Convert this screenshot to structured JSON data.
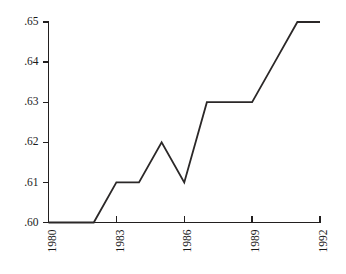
{
  "chart_data": {
    "type": "line",
    "title": "",
    "xlabel": "",
    "ylabel": "",
    "x": [
      1980,
      1981,
      1982,
      1983,
      1984,
      1985,
      1986,
      1987,
      1988,
      1989,
      1990,
      1991,
      1992
    ],
    "values": [
      0.6,
      0.6,
      0.6,
      0.61,
      0.61,
      0.62,
      0.61,
      0.63,
      0.63,
      0.63,
      0.64,
      0.65,
      0.65
    ],
    "series": [
      {
        "name": "series-1",
        "values": [
          0.6,
          0.6,
          0.6,
          0.61,
          0.61,
          0.62,
          0.61,
          0.63,
          0.63,
          0.63,
          0.64,
          0.65,
          0.65
        ]
      }
    ],
    "xlim": [
      1980,
      1992
    ],
    "ylim": [
      0.6,
      0.65
    ],
    "grid": false,
    "legend": false,
    "legend_position": "none",
    "x_tick_values": [
      1980,
      1983,
      1986,
      1989,
      1992
    ],
    "x_tick_labels": [
      "1980",
      "1983",
      "1986",
      "1989",
      "1992"
    ],
    "x_tick_rotation": 90,
    "y_tick_values": [
      0.6,
      0.61,
      0.62,
      0.63,
      0.64,
      0.65
    ],
    "y_tick_labels": [
      ".60",
      ".61",
      ".62",
      ".63",
      ".64",
      ".65"
    ],
    "line_color": "#2b2828",
    "axis_color": "#221f1f",
    "background_color": "#ffffff"
  },
  "axes": {
    "y_labels": [
      {
        "text": ".65",
        "value": 0.65
      },
      {
        "text": ".64",
        "value": 0.64
      },
      {
        "text": ".63",
        "value": 0.63
      },
      {
        "text": ".62",
        "value": 0.62
      },
      {
        "text": ".61",
        "value": 0.61
      },
      {
        "text": ".60",
        "value": 0.6
      }
    ],
    "x_labels": [
      {
        "text": "1980",
        "value": 1980
      },
      {
        "text": "1983",
        "value": 1983
      },
      {
        "text": "1986",
        "value": 1986
      },
      {
        "text": "1989",
        "value": 1989
      },
      {
        "text": "1992",
        "value": 1992
      }
    ]
  }
}
